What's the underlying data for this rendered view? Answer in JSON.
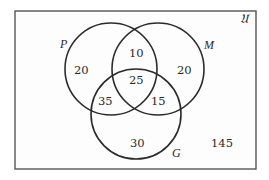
{
  "diagram": {
    "type": "venn-3-set",
    "universe_label": "𝔘",
    "sets": [
      {
        "id": "P",
        "label": "P"
      },
      {
        "id": "M",
        "label": "M"
      },
      {
        "id": "G",
        "label": "G"
      }
    ],
    "regions": {
      "P_only": "20",
      "M_only": "20",
      "G_only": "30",
      "P_and_M_only": "10",
      "P_and_G_only": "35",
      "M_and_G_only": "15",
      "P_M_G": "25",
      "outside": "145"
    },
    "colors": {
      "stroke": "#2b2b2b",
      "frame": "#555555",
      "background": "#ffffff"
    }
  }
}
